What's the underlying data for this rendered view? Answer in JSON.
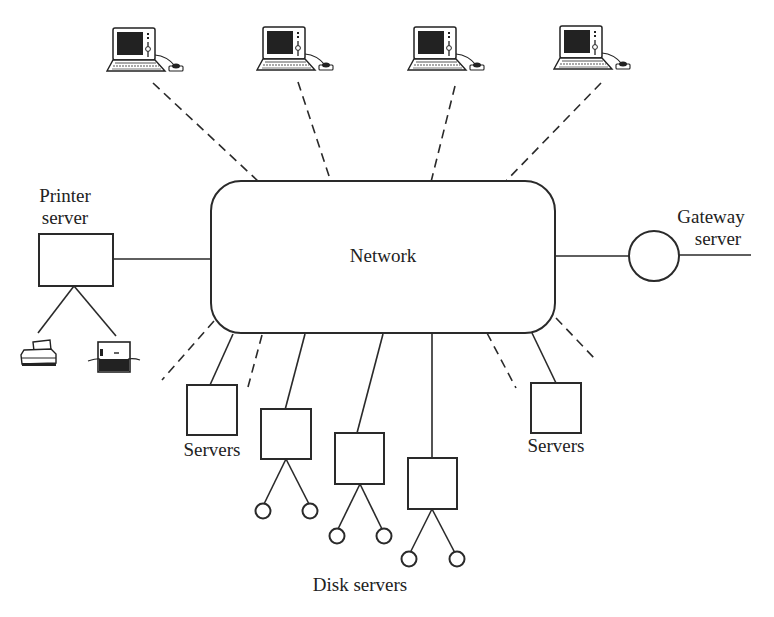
{
  "diagram": {
    "type": "network topology",
    "center": {
      "label": "Network"
    },
    "labels": {
      "network": "Network",
      "printer_server_line1": "Printer",
      "printer_server_line2": "server",
      "gateway_server_line1": "Gateway",
      "gateway_server_line2": "server",
      "servers_left": "Servers",
      "servers_right": "Servers",
      "disk_servers": "Disk servers"
    },
    "nodes": [
      {
        "id": "workstation-1",
        "kind": "workstation",
        "link": "dashed"
      },
      {
        "id": "workstation-2",
        "kind": "workstation",
        "link": "dashed"
      },
      {
        "id": "workstation-3",
        "kind": "workstation",
        "link": "dashed"
      },
      {
        "id": "workstation-4",
        "kind": "workstation",
        "link": "dashed"
      },
      {
        "id": "printer-server",
        "kind": "server-box",
        "link": "solid",
        "children": [
          "dot-matrix-printer",
          "laser-printer"
        ]
      },
      {
        "id": "gateway-server",
        "kind": "circle",
        "link": "solid",
        "external_link": "solid"
      },
      {
        "id": "server-left",
        "kind": "server-box",
        "link": "solid"
      },
      {
        "id": "server-right",
        "kind": "server-box",
        "link": "solid"
      },
      {
        "id": "disk-server-1",
        "kind": "server-box",
        "link": "solid",
        "disks": 2
      },
      {
        "id": "disk-server-2",
        "kind": "server-box",
        "link": "solid",
        "disks": 2
      },
      {
        "id": "disk-server-3",
        "kind": "server-box",
        "link": "solid",
        "disks": 2
      }
    ],
    "dashed_stubs": 4
  }
}
